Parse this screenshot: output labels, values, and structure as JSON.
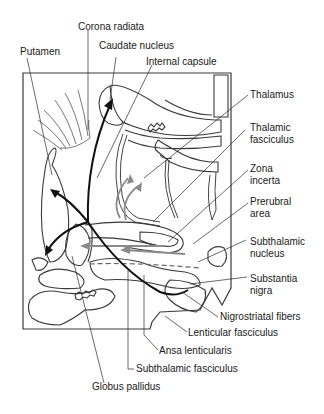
{
  "diagram": {
    "type": "anatomical-line-drawing",
    "colors": {
      "outline": "#3a3a3a",
      "dark_arrow": "#111111",
      "gray_arrow": "#8a8a8a",
      "leader_line": "#2a2a2a",
      "background": "#ffffff"
    },
    "labels": {
      "corona_radiata": "Corona radiata",
      "putamen": "Putamen",
      "caudate_nucleus": "Caudate nucleus",
      "internal_capsule": "Internal capsule",
      "thalamus": "Thalamus",
      "thalamic_fasciculus_1": "Thalamic",
      "thalamic_fasciculus_2": "fasciculus",
      "zona_incerta_1": "Zona",
      "zona_incerta_2": "incerta",
      "prerubral_area_1": "Prerubral",
      "prerubral_area_2": "area",
      "subthalamic_nucleus_1": "Subthalamic",
      "subthalamic_nucleus_2": "nucleus",
      "substantia_nigra_1": "Substantia",
      "substantia_nigra_2": "nigra",
      "nigrostriatal_fibers": "Nigrostriatal fibers",
      "lenticular_fasciculus": "Lenticular fasciculus",
      "ansa_lenticularis": "Ansa lenticularis",
      "subthalamic_fasciculus": "Subthalamic fasciculus",
      "globus_pallidus": "Globus pallidus"
    }
  }
}
